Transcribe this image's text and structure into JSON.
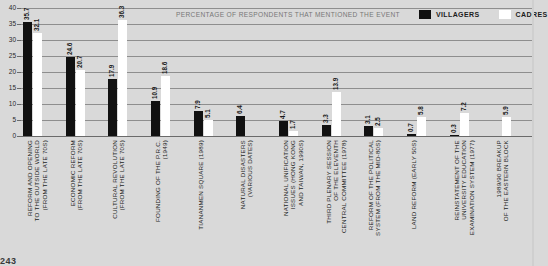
{
  "chart_data": {
    "type": "bar",
    "title": "PERCENTAGE OF RESPONDENTS THAT MENTIONED THE EVENT",
    "xlabel": "",
    "ylabel": "",
    "ylim": [
      0,
      40
    ],
    "yticks": [
      "0",
      "5",
      "10",
      "15",
      "20",
      "25",
      "30",
      "35",
      "40"
    ],
    "grid": true,
    "legend_position": "top-right",
    "categories": [
      "REFORM AND OPENING\nTO THE OUTSIDE WORLD\n(FROM THE LATE 70S)",
      "ECONOMIC REFORM\n(FROM THE LATE 70S)",
      "CULTURAL REVOLUTION\n(FROM THE LATE 70S)",
      "FOUNDING OF THE P.R.C.\n(1949)",
      "TIANANMEN SQUARE (1989)",
      "NATURAL DISASTERS\n(VARIOUS DATES)",
      "NATIONAL UNIFICATION\nISSUES (HONG KONG\nAND TAIWAN, 1990S)",
      "THIRD PLENARY SESSION\nOF THE ELEVENTH\nCENTRAL COMMITTEE (1978)",
      "REFORM OF THE POLITICAL\nSYSTEM (FROM THE MID-80S)",
      "LAND REFORM (EARLY 50S)",
      "REINSTATEMENT OF THE\nUNIVERSITY EDUCATION\nEXAMINATION SYSTEM (1977)",
      "1989/90 BREAKUP\nOF THE EASTERN BLOCK"
    ],
    "series": [
      {
        "name": "VILLAGERS",
        "color": "#111111",
        "values": [
          35.7,
          24.6,
          17.9,
          10.9,
          7.9,
          6.4,
          4.7,
          3.3,
          3.1,
          0.7,
          0.3,
          null
        ]
      },
      {
        "name": "CADRES",
        "color": "#ffffff",
        "values": [
          32.1,
          20.7,
          36.3,
          18.6,
          5.1,
          null,
          1.7,
          13.9,
          2.5,
          5.8,
          7.2,
          5.9
        ]
      }
    ]
  },
  "legend": {
    "caption": "PERCENTAGE OF RESPONDENTS THAT MENTIONED THE EVENT",
    "entries": [
      {
        "label": "VILLAGERS",
        "color": "#111111"
      },
      {
        "label": "CADRES",
        "color": "#ffffff"
      }
    ]
  },
  "footer": {
    "text": "243"
  }
}
